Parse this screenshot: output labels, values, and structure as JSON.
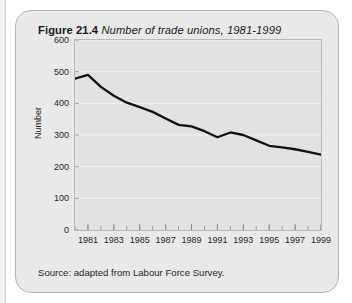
{
  "figure": {
    "label": "Figure 21.4",
    "caption": "Number of trade unions, 1981-1999",
    "source": "Source: adapted from Labour Force Survey."
  },
  "colors": {
    "card_background": "#e9e9e9",
    "card_border": "#b4b4b4",
    "plot_background": "#e2e2e2",
    "plot_border": "#b9b9b9",
    "gridline": "#f2f2f2",
    "line": "#111111",
    "text": "#1f1f1f"
  },
  "chart_data": {
    "type": "line",
    "title": "Number of trade unions, 1981-1999",
    "xlabel": "",
    "ylabel": "Number",
    "xlim": [
      1980,
      1999
    ],
    "ylim": [
      0,
      600
    ],
    "yticks": [
      0,
      100,
      200,
      300,
      400,
      500,
      600
    ],
    "ytick_labels": [
      "0",
      "100",
      "200",
      "300",
      "400",
      "500",
      "600"
    ],
    "xticks": [
      1981,
      1983,
      1985,
      1987,
      1989,
      1991,
      1993,
      1995,
      1997,
      1999
    ],
    "xtick_labels": [
      "1981",
      "1983",
      "1985",
      "1987",
      "1989",
      "1991",
      "1993",
      "1995",
      "1997",
      "1999"
    ],
    "x_minor_tick_interval": 1,
    "grid": true,
    "grid_axis": "y",
    "legend": false,
    "series": [
      {
        "name": "Number of trade unions",
        "x": [
          1980,
          1981,
          1982,
          1983,
          1984,
          1985,
          1986,
          1987,
          1988,
          1989,
          1990,
          1991,
          1992,
          1993,
          1994,
          1995,
          1996,
          1997,
          1998,
          1999
        ],
        "values": [
          478,
          490,
          452,
          424,
          402,
          388,
          373,
          352,
          332,
          327,
          312,
          293,
          308,
          300,
          283,
          266,
          261,
          255,
          247,
          238
        ]
      }
    ]
  }
}
